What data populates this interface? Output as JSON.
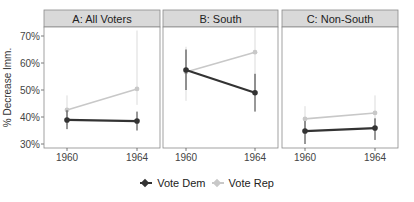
{
  "chart_data": {
    "type": "line",
    "ylabel": "% Decrease Imm.",
    "xlabel": "",
    "x": [
      "1960",
      "1964"
    ],
    "y_ticks": [
      "30%",
      "40%",
      "50%",
      "60%",
      "70%"
    ],
    "ylim": [
      28,
      73
    ],
    "grid": false,
    "legend_position": "bottom",
    "legend": [
      "Vote Dem",
      "Vote Rep"
    ],
    "colors": {
      "Vote Dem": "#333333",
      "Vote Rep": "#c8c8c8"
    },
    "panels": [
      {
        "title": "A: All Voters",
        "series": [
          {
            "name": "Vote Dem",
            "values": [
              38.9,
              38.5
            ],
            "ci_low": [
              35.5,
              35.0
            ],
            "ci_high": [
              42.5,
              42.0
            ]
          },
          {
            "name": "Vote Rep",
            "values": [
              42.6,
              50.4
            ],
            "ci_low": [
              37.0,
              44.5
            ],
            "ci_high": [
              48.0,
              72.0
            ]
          }
        ]
      },
      {
        "title": "B: South",
        "series": [
          {
            "name": "Vote Dem",
            "values": [
              57.4,
              49.0
            ],
            "ci_low": [
              50.0,
              42.0
            ],
            "ci_high": [
              65.0,
              56.0
            ]
          },
          {
            "name": "Vote Rep",
            "values": [
              56.7,
              64.0
            ],
            "ci_low": [
              46.0,
              50.0
            ],
            "ci_high": [
              66.0,
              75.0
            ]
          }
        ]
      },
      {
        "title": "C: Non-South",
        "series": [
          {
            "name": "Vote Dem",
            "values": [
              34.8,
              35.9
            ],
            "ci_low": [
              30.0,
              31.5
            ],
            "ci_high": [
              38.5,
              39.5
            ]
          },
          {
            "name": "Vote Rep",
            "values": [
              39.3,
              41.5
            ],
            "ci_low": [
              34.5,
              35.0
            ],
            "ci_high": [
              44.0,
              48.0
            ]
          }
        ]
      }
    ]
  },
  "legend": {
    "dem_label": "Vote Dem",
    "rep_label": "Vote Rep"
  }
}
